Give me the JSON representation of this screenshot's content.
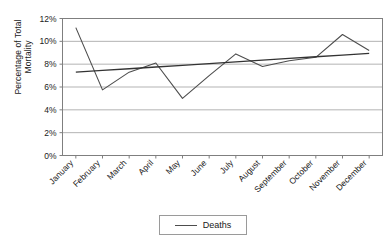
{
  "chart_data": {
    "type": "line",
    "title": "",
    "xlabel": "",
    "ylabel": "Percentage of Total Mortality",
    "ylabel_line1": "Percentage of Total",
    "ylabel_line2": "Mortality",
    "categories": [
      "January",
      "February",
      "March",
      "April",
      "May",
      "June",
      "July",
      "August",
      "September",
      "October",
      "November",
      "December"
    ],
    "series": [
      {
        "name": "Deaths",
        "values": [
          11.2,
          5.75,
          7.3,
          8.1,
          5.0,
          7.0,
          8.9,
          7.8,
          8.3,
          8.6,
          10.6,
          9.2
        ],
        "color": "#4d4d4d"
      },
      {
        "name": "Linear trend",
        "values": [
          7.3,
          7.45,
          7.6,
          7.75,
          7.9,
          8.05,
          8.2,
          8.35,
          8.5,
          8.65,
          8.8,
          8.95
        ],
        "color": "#333333"
      }
    ],
    "ylim": [
      0,
      12
    ],
    "ytick_labels": [
      "0%",
      "2%",
      "4%",
      "6%",
      "8%",
      "10%",
      "12%"
    ],
    "ytick_values": [
      0,
      2,
      4,
      6,
      8,
      10,
      12
    ],
    "grid": true,
    "grid_color": "#b3b3b3",
    "legend_position": "bottom",
    "legend_entries": [
      "Deaths"
    ],
    "plot_border_color": "#7f7f7f",
    "background": "#ffffff"
  },
  "legend": {
    "deaths_label": "Deaths"
  }
}
